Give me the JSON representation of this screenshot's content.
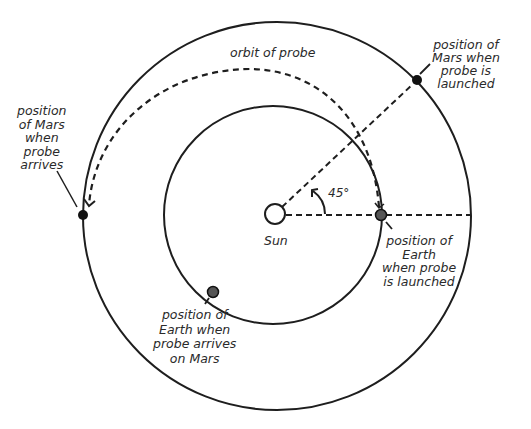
{
  "diagram": {
    "colors": {
      "line": "#1e1e1e",
      "planet_mars": "#111111",
      "planet_earth": "#444444",
      "background": "#ffffff"
    },
    "bodies": {
      "sun": {
        "label": "Sun",
        "cx": 275,
        "cy": 214,
        "r": 10
      },
      "earth_orbit": {
        "cx": 273,
        "cy": 215,
        "r": 109
      },
      "mars_orbit": {
        "cx": 277,
        "cy": 216,
        "r": 194
      }
    },
    "markers": [
      {
        "id": "mars-launch",
        "body": "Mars",
        "cx": 417,
        "cy": 80,
        "r": 5,
        "fill": "#111111"
      },
      {
        "id": "mars-arrive",
        "body": "Mars",
        "cx": 83,
        "cy": 215,
        "r": 5,
        "fill": "#111111"
      },
      {
        "id": "earth-launch",
        "body": "Earth",
        "cx": 381,
        "cy": 215,
        "r": 5.5,
        "fill": "#555555"
      },
      {
        "id": "earth-arrive",
        "body": "Earth",
        "cx": 213,
        "cy": 292,
        "r": 5.5,
        "fill": "#555555"
      }
    ],
    "angle": {
      "value": "45°"
    },
    "labels": {
      "orbit_of_probe": "orbit of probe",
      "mars_launched": [
        "position of",
        "Mars when",
        "probe is",
        "launched"
      ],
      "mars_arrives": [
        "position",
        "of Mars",
        "when",
        "probe",
        "arrives"
      ],
      "earth_launched": [
        "position of",
        "Earth",
        "when probe",
        "is launched"
      ],
      "earth_arrives": [
        "position of",
        "Earth when",
        "probe arrives",
        "on Mars"
      ],
      "sun": "Sun",
      "angle": "45°"
    }
  }
}
